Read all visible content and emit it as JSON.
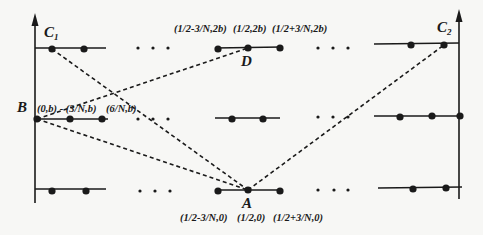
{
  "diagram": {
    "points": {
      "C1": {
        "label": "C",
        "sub": "1"
      },
      "C2": {
        "label": "C",
        "sub": "2"
      },
      "B": {
        "label": "B"
      },
      "D": {
        "label": "D"
      },
      "A": {
        "label": "A"
      }
    },
    "coords": {
      "b_left": "(0,b) - (3/N,b)",
      "b_right": "(6/N,b)",
      "d_left": "(1/2-3/N,2b)",
      "d_mid": "(1/2,2b)",
      "d_right": "(1/2+3/N,2b)",
      "a_left": "(1/2-3/N,0)",
      "a_mid": "(1/2,0)",
      "a_right": "(1/2+3/N,0)"
    },
    "colors": {
      "line": "#1a1a1a",
      "background": "#f7f7f5"
    }
  }
}
